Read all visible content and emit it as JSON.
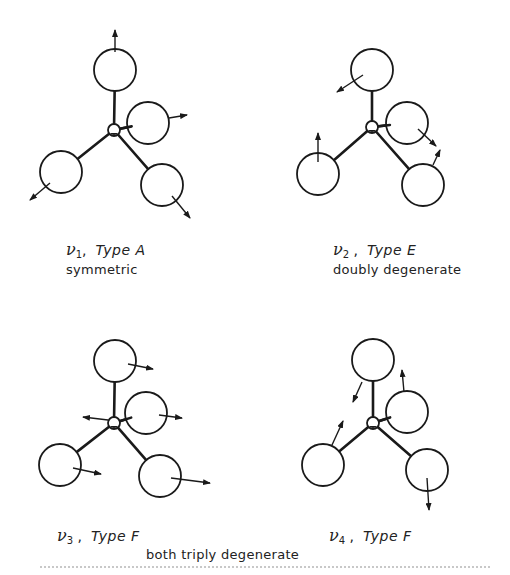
{
  "figure": {
    "colors": {
      "ink": "#1a1a1a",
      "background": "#ffffff"
    },
    "panels": [
      {
        "id": "nu1",
        "mode_symbol": "ν",
        "mode_index": "1",
        "type_label": "Type A",
        "description": "symmetric",
        "center": [
          114,
          130
        ],
        "atoms": [
          {
            "name": "top",
            "cx": 115,
            "cy": 70,
            "arrow": [
              115,
              52,
              115,
              30
            ]
          },
          {
            "name": "right",
            "cx": 148,
            "cy": 123,
            "arrow": [
              169,
              118,
              187,
              115
            ]
          },
          {
            "name": "lower-left",
            "cx": 61,
            "cy": 172,
            "arrow": [
              50,
              183,
              30,
              200
            ]
          },
          {
            "name": "lower-right",
            "cx": 162,
            "cy": 185,
            "arrow": [
              172,
              196,
              190,
              218
            ]
          }
        ]
      },
      {
        "id": "nu2",
        "mode_symbol": "ν",
        "mode_index": "2",
        "type_label": "Type E",
        "description": "doubly degenerate",
        "center": [
          372,
          127
        ],
        "atoms": [
          {
            "name": "top",
            "cx": 372,
            "cy": 70,
            "arrow": [
              363,
              75,
              337,
              92
            ]
          },
          {
            "name": "right",
            "cx": 407,
            "cy": 123,
            "arrow": [
              418,
              129,
              436,
              146
            ]
          },
          {
            "name": "lower-left",
            "cx": 318,
            "cy": 174,
            "arrow": [
              318,
              162,
              318,
              133
            ]
          },
          {
            "name": "lower-right",
            "cx": 423,
            "cy": 185,
            "arrow": [
              433,
              165,
              440,
              150
            ]
          }
        ]
      },
      {
        "id": "nu3",
        "mode_symbol": "ν",
        "mode_index": "3",
        "type_label": "Type F",
        "description": "",
        "center": [
          114,
          423
        ],
        "atoms": [
          {
            "name": "top",
            "cx": 115,
            "cy": 361,
            "arrow": [
              128,
              364,
              153,
              369
            ]
          },
          {
            "name": "right",
            "cx": 146,
            "cy": 413,
            "arrow": [
              159,
              415,
              182,
              418
            ]
          },
          {
            "name": "lower-left",
            "cx": 60,
            "cy": 465,
            "arrow": [
              73,
              468,
              101,
              474
            ]
          },
          {
            "name": "lower-right",
            "cx": 160,
            "cy": 476,
            "arrow": [
              171,
              478,
              210,
              483
            ]
          }
        ],
        "center_arrow": [
          108,
          420,
          83,
          417
        ]
      },
      {
        "id": "nu4",
        "mode_symbol": "ν",
        "mode_index": "4",
        "type_label": "Type F",
        "description": "",
        "center": [
          373,
          423
        ],
        "atoms": [
          {
            "name": "top",
            "cx": 373,
            "cy": 360,
            "arrow": [
              362,
              382,
              353,
              402
            ]
          },
          {
            "name": "right",
            "cx": 407,
            "cy": 412,
            "arrow": [
              404,
              392,
              402,
              370
            ]
          },
          {
            "name": "lower-left",
            "cx": 323,
            "cy": 465,
            "arrow": [
              332,
              445,
              343,
              421
            ]
          },
          {
            "name": "lower-right",
            "cx": 427,
            "cy": 470,
            "arrow": [
              427,
              478,
              429,
              510
            ]
          }
        ]
      }
    ],
    "shared_caption": "both triply degenerate"
  }
}
